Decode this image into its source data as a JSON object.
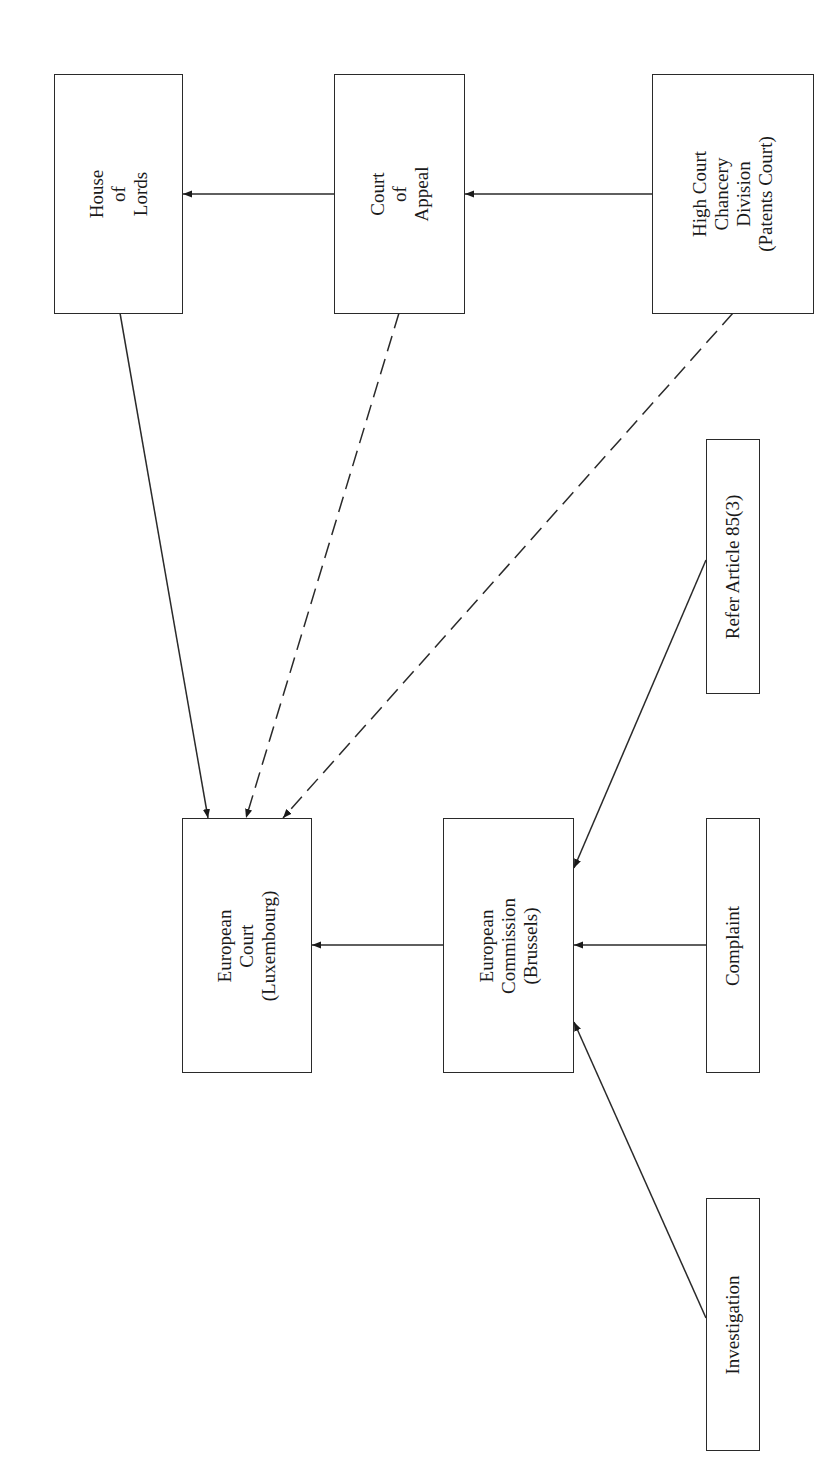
{
  "diagram": {
    "orientation": "rotated-90-ccw",
    "nodes": [
      {
        "id": "house_of_lords",
        "lines": [
          "House",
          "of",
          "Lords"
        ],
        "box": [
          54,
          74,
          128,
          239
        ]
      },
      {
        "id": "court_of_appeal",
        "lines": [
          "Court",
          "of",
          "Appeal"
        ],
        "box": [
          334,
          74,
          130,
          239
        ]
      },
      {
        "id": "high_court",
        "lines": [
          "High Court",
          "Chancery",
          "Division",
          "(Patents Court)"
        ],
        "box": [
          652,
          74,
          161,
          239
        ]
      },
      {
        "id": "european_court",
        "lines": [
          "European",
          "Court",
          "(Luxembourg)"
        ],
        "box": [
          182,
          818,
          129,
          254
        ]
      },
      {
        "id": "european_commission",
        "lines": [
          "European",
          "Commission",
          "(Brussels)"
        ],
        "box": [
          443,
          818,
          130,
          254
        ]
      },
      {
        "id": "refer_article",
        "lines": [
          "Refer Article 85(3)"
        ],
        "box": [
          706,
          439,
          53,
          254
        ]
      },
      {
        "id": "complaint",
        "lines": [
          "Complaint"
        ],
        "box": [
          706,
          818,
          53,
          254
        ]
      },
      {
        "id": "investigation",
        "lines": [
          "Investigation"
        ],
        "box": [
          706,
          1198,
          53,
          252
        ]
      }
    ],
    "edges": [
      {
        "from": "court_of_appeal",
        "to": "house_of_lords",
        "style": "solid",
        "points": [
          334,
          194,
          183,
          194
        ]
      },
      {
        "from": "high_court",
        "to": "court_of_appeal",
        "style": "solid",
        "points": [
          652,
          194,
          465,
          194
        ]
      },
      {
        "from": "house_of_lords",
        "to": "european_court",
        "style": "solid",
        "points": [
          120,
          313,
          208,
          818
        ]
      },
      {
        "from": "court_of_appeal",
        "to": "european_court",
        "style": "dashed",
        "points": [
          399,
          313,
          246,
          818
        ]
      },
      {
        "from": "high_court",
        "to": "european_court",
        "style": "dashed",
        "points": [
          733,
          313,
          283,
          818
        ]
      },
      {
        "from": "european_commission",
        "to": "european_court",
        "style": "solid",
        "points": [
          443,
          945,
          312,
          945
        ]
      },
      {
        "from": "refer_article",
        "to": "european_commission",
        "style": "solid",
        "points": [
          706,
          560,
          574,
          868
        ]
      },
      {
        "from": "complaint",
        "to": "european_commission",
        "style": "solid",
        "points": [
          706,
          945,
          574,
          945
        ]
      },
      {
        "from": "investigation",
        "to": "european_commission",
        "style": "solid",
        "points": [
          706,
          1318,
          574,
          1022
        ]
      }
    ]
  },
  "labels": {
    "house_of_lords": [
      "House",
      "of",
      "Lords"
    ],
    "court_of_appeal": [
      "Court",
      "of",
      "Appeal"
    ],
    "high_court": [
      "High Court",
      "Chancery",
      "Division",
      "(Patents Court)"
    ],
    "european_court": [
      "European",
      "Court",
      "(Luxembourg)"
    ],
    "european_commission": [
      "European",
      "Commission",
      "(Brussels)"
    ],
    "refer_article": [
      "Refer Article 85(3)"
    ],
    "complaint": [
      "Complaint"
    ],
    "investigation": [
      "Investigation"
    ]
  },
  "colors": {
    "stroke": "#2a2a2a",
    "background": "#ffffff",
    "text": "#1a1a1a"
  }
}
